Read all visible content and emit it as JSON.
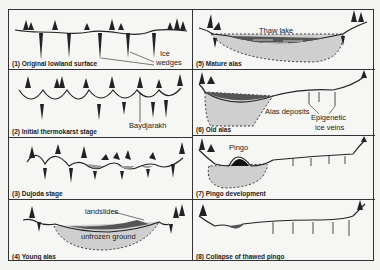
{
  "figure": {
    "panels": [
      {
        "id": 1,
        "caption": "(1) Original lowland surface",
        "labels": [
          "Ice",
          "wedges"
        ]
      },
      {
        "id": 2,
        "caption": "(2) Initial thermokarst stage",
        "labels": [
          "Baydjarakh"
        ]
      },
      {
        "id": 3,
        "caption": "(3) Dujoda stage",
        "labels": []
      },
      {
        "id": 4,
        "caption": "(4) Young alas",
        "labels": [
          "landslides",
          "unfrozen ground"
        ]
      },
      {
        "id": 5,
        "caption": "(5) Mature alas",
        "labels": [
          "Thaw lake"
        ]
      },
      {
        "id": 6,
        "caption": "(6) Old alas",
        "labels": [
          "Alas deposits",
          "Epigenetic",
          "ice veins"
        ]
      },
      {
        "id": 7,
        "caption": "(7) Pingo development",
        "labels": [
          "Pingo"
        ]
      },
      {
        "id": 8,
        "caption": "(8) Collapse of thawed pingo",
        "labels": []
      }
    ],
    "colors": {
      "line": "#222222",
      "fill_grey": "#c8c8c8",
      "water": "#555555",
      "background": "#f6f6f4"
    }
  }
}
